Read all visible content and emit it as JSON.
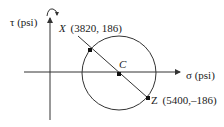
{
  "diagram": {
    "type": "mohr-circle",
    "axes": {
      "tau_label": "τ (psi)",
      "sigma_label": "σ (psi)"
    },
    "points": {
      "X": {
        "name": "X",
        "coords": "(3820, 186)",
        "sigma": 3820,
        "tau": 186
      },
      "Z": {
        "name": "Z",
        "coords": "(5400,–186)",
        "sigma": 5400,
        "tau": -186
      },
      "C": {
        "name": "C"
      }
    },
    "colors": {
      "line": "#333333",
      "text": "#1a1a1a",
      "background": "#ffffff"
    }
  }
}
